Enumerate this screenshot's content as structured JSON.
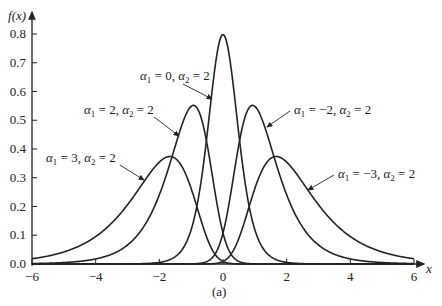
{
  "chart_data": {
    "type": "line",
    "title": "",
    "caption": "(a)",
    "xlabel": "x",
    "ylabel": "f(x)",
    "xlim": [
      -6,
      6
    ],
    "ylim": [
      0,
      0.8
    ],
    "xticks": [
      -6,
      -4,
      -2,
      0,
      2,
      4,
      6
    ],
    "yticks": [
      0.0,
      0.1,
      0.2,
      0.3,
      0.4,
      0.5,
      0.6,
      0.7,
      0.8
    ],
    "ytick_labels": [
      "0.0",
      "0.1",
      "0.2",
      "0.3",
      "0.4",
      "0.5",
      "0.6",
      "0.7",
      "0.8"
    ],
    "grid": false,
    "distribution": "Johnson SU: f(x)=a2/sqrt(2pi)/sqrt(1+x^2)*exp(-0.5*(a1+a2*asinh(x))^2)",
    "series": [
      {
        "name": "α1 = 0, α2 = 2",
        "alpha1": 0,
        "alpha2": 2,
        "peak_x": 0.0,
        "peak_y": 0.78
      },
      {
        "name": "α1 = 2, α2 = 2",
        "alpha1": 2,
        "alpha2": 2,
        "peak_x": -0.9,
        "peak_y": 0.54
      },
      {
        "name": "α1 = −2, α2 = 2",
        "alpha1": -2,
        "alpha2": 2,
        "peak_x": 0.9,
        "peak_y": 0.54
      },
      {
        "name": "α1 = 3, α2 = 2",
        "alpha1": 3,
        "alpha2": 2,
        "peak_x": -1.6,
        "peak_y": 0.37
      },
      {
        "name": "α1 = −3, α2 = 2",
        "alpha1": -3,
        "alpha2": 2,
        "peak_x": 1.6,
        "peak_y": 0.37
      }
    ],
    "annotations": [
      {
        "text_a1": "0",
        "x": 140,
        "y": 80,
        "ax1": 183,
        "ay1": 84,
        "ax2": 212,
        "ay2": 99
      },
      {
        "text_a1": "2",
        "x": 84,
        "y": 114,
        "ax1": 154,
        "ay1": 117,
        "ax2": 179,
        "ay2": 136
      },
      {
        "text_a1": "3",
        "x": 46,
        "y": 162,
        "ax1": 120,
        "ay1": 165,
        "ax2": 144,
        "ay2": 180
      },
      {
        "text_a1": "−2",
        "x": 294,
        "y": 114,
        "ax1": 290,
        "ay1": 111,
        "ax2": 267,
        "ay2": 127
      },
      {
        "text_a1": "−3",
        "x": 338,
        "y": 178,
        "ax1": 334,
        "ay1": 175,
        "ax2": 308,
        "ay2": 190
      }
    ]
  }
}
